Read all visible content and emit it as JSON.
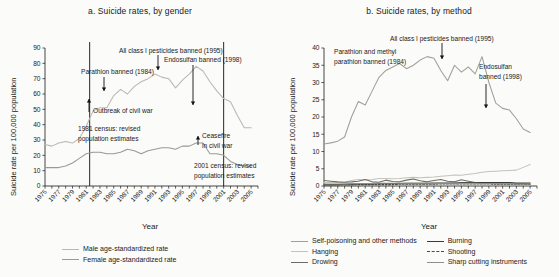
{
  "figure": {
    "background": "#fbfbf9",
    "axis_color": "#1a1a1a"
  },
  "panel_a": {
    "title": "a. Suicide rates, by gender",
    "ylabel": "Suicide rate per 100,000 population",
    "xlabel": "Year",
    "legend": [
      {
        "label": "Male age-standardized rate",
        "color": "#b9b9b0",
        "style": "solid"
      },
      {
        "label": "Female age-standardized rate",
        "color": "#9a9a92",
        "style": "solid"
      }
    ],
    "annotations": [
      {
        "name": "parathion-banned",
        "text": "Parathion banned (1984)"
      },
      {
        "name": "all-class-i-pesticides-banned",
        "text": "All class I pesticides banned (1995)"
      },
      {
        "name": "endosulfan-banned",
        "text": "Endosulfan banned (1998)"
      },
      {
        "name": "outbreak-civil-war",
        "text": "Outbreak of civil war"
      },
      {
        "name": "census-1981-line1",
        "text": "1981 census: revised"
      },
      {
        "name": "census-1981-line2",
        "text": "population estimates"
      },
      {
        "name": "census-2001-line1",
        "text": "2001 census: revised"
      },
      {
        "name": "census-2001-line2",
        "text": "population estimates"
      },
      {
        "name": "ceasefire-line1",
        "text": "Ceasefire"
      },
      {
        "name": "ceasefire-line2",
        "text": "in civil war"
      }
    ]
  },
  "panel_b": {
    "title": "b. Suicide rates, by method",
    "ylabel": "Suicide rate per 100,000 population",
    "xlabel": "Year",
    "legend": [
      {
        "label": "Self-poisoning and other methods",
        "color": "#a0a098",
        "style": "solid"
      },
      {
        "label": "Hanging",
        "color": "#c3c3bb",
        "style": "solid"
      },
      {
        "label": "Drowing",
        "color": "#6c6c66",
        "style": "solid"
      },
      {
        "label": "Burning",
        "color": "#3a3a36",
        "style": "solid"
      },
      {
        "label": "Shooting",
        "color": "#4a4a45",
        "style": "dashed"
      },
      {
        "label": "Sharp cutting instruments",
        "color": "#8e8e86",
        "style": "solid"
      }
    ],
    "annotations": [
      {
        "name": "parathion-methyl-line1",
        "text": "Parathion and methyl"
      },
      {
        "name": "parathion-methyl-line2",
        "text": "parathion banned (1984)"
      },
      {
        "name": "all-class-i-pesticides-banned",
        "text": "All class I pesticides banned (1995)"
      },
      {
        "name": "endosulfan-banned-line1",
        "text": "Endosulfan"
      },
      {
        "name": "endosulfan-banned-line2",
        "text": "banned (1998)"
      }
    ]
  },
  "chart_data": [
    {
      "type": "line",
      "panel": "a",
      "title": "a. Suicide rates, by gender",
      "xlabel": "Year",
      "ylabel": "Suicide rate per 100,000 population",
      "xlim": [
        1975,
        2006
      ],
      "ylim": [
        0,
        90
      ],
      "yticks": [
        0,
        10,
        20,
        30,
        40,
        50,
        60,
        70,
        80,
        90
      ],
      "xticks": [
        1975,
        1977,
        1979,
        1981,
        1983,
        1985,
        1987,
        1989,
        1991,
        1993,
        1995,
        1997,
        1999,
        2001,
        2003,
        2005
      ],
      "grid": false,
      "legend_position": "bottom",
      "x": [
        1975,
        1976,
        1977,
        1978,
        1979,
        1980,
        1981,
        1982,
        1983,
        1984,
        1985,
        1986,
        1987,
        1988,
        1989,
        1990,
        1991,
        1992,
        1993,
        1994,
        1995,
        1996,
        1997,
        1998,
        1999,
        2000,
        2001,
        2002,
        2003,
        2004,
        2005
      ],
      "series": [
        {
          "name": "Male age-standardized rate",
          "color": "#b9b9b0",
          "values": [
            27,
            26,
            28,
            29,
            28,
            31,
            39,
            49,
            51,
            51,
            59,
            63,
            60,
            65,
            68,
            70,
            73,
            71,
            70,
            64,
            69,
            73,
            78,
            75,
            68,
            62,
            57,
            55,
            46,
            38,
            38
          ]
        },
        {
          "name": "Female age-standardized rate",
          "color": "#9a9a92",
          "values": [
            12,
            12,
            12,
            13,
            15,
            18,
            21,
            22,
            22,
            21,
            21,
            22,
            24,
            23,
            21,
            23,
            24,
            25,
            25,
            24,
            26,
            26,
            28,
            28,
            21,
            21,
            20,
            16,
            14,
            13,
            13
          ]
        }
      ],
      "annotations": [
        {
          "text": "Parathion banned (1984)",
          "x": 1984,
          "y": 70
        },
        {
          "text": "All class I pesticides banned (1995)",
          "x": 1995,
          "y": 84
        },
        {
          "text": "Endosulfan banned (1998)",
          "x": 1998,
          "y": 80
        },
        {
          "text": "Outbreak of civil war",
          "x": 1983,
          "y": 50
        },
        {
          "text": "1981 census: revised population estimates",
          "x": 1981,
          "y": 38
        },
        {
          "text": "2001 census: revised population estimates",
          "x": 2001,
          "y": 12
        },
        {
          "text": "Ceasefire in civil war",
          "x": 2002,
          "y": 32
        }
      ],
      "vertical_rules": [
        1981.5,
        2001
      ]
    },
    {
      "type": "line",
      "panel": "b",
      "title": "b. Suicide rates, by method",
      "xlabel": "Year",
      "ylabel": "Suicide rate per 100,000 population",
      "xlim": [
        1975,
        2006
      ],
      "ylim": [
        0,
        40
      ],
      "yticks": [
        0,
        5,
        10,
        15,
        20,
        25,
        30,
        35,
        40
      ],
      "xticks": [
        1975,
        1977,
        1979,
        1981,
        1983,
        1985,
        1987,
        1989,
        1991,
        1993,
        1995,
        1997,
        1999,
        2001,
        2003,
        2005
      ],
      "grid": false,
      "legend_position": "bottom",
      "x": [
        1975,
        1976,
        1977,
        1978,
        1979,
        1980,
        1981,
        1982,
        1983,
        1984,
        1985,
        1986,
        1987,
        1988,
        1989,
        1990,
        1991,
        1992,
        1993,
        1994,
        1995,
        1996,
        1997,
        1998,
        1999,
        2000,
        2001,
        2002,
        2003,
        2004,
        2005
      ],
      "series": [
        {
          "name": "Self-poisoning and other methods",
          "color": "#a0a098",
          "values": [
            12.2,
            12.5,
            13.0,
            14.2,
            20.0,
            24.5,
            23.5,
            27.5,
            31.5,
            33.5,
            34.5,
            35.5,
            34.0,
            35.0,
            36.5,
            37.5,
            37.0,
            33.5,
            30.5,
            35.0,
            33.0,
            34.5,
            32.5,
            37.5,
            30.0,
            24.0,
            22.5,
            22.0,
            19.5,
            16.5,
            15.5
          ]
        },
        {
          "name": "Hanging",
          "color": "#c3c3bb",
          "values": [
            1.0,
            1.0,
            1.0,
            1.1,
            1.6,
            1.9,
            1.8,
            1.9,
            2.2,
            2.2,
            2.1,
            2.2,
            2.4,
            2.5,
            2.4,
            2.5,
            2.6,
            2.8,
            3.0,
            3.2,
            3.1,
            3.4,
            3.6,
            4.0,
            4.2,
            4.3,
            4.4,
            4.5,
            4.6,
            5.4,
            6.2
          ]
        },
        {
          "name": "Drowing",
          "color": "#6c6c66",
          "values": [
            1.6,
            1.4,
            1.2,
            1.1,
            1.2,
            1.4,
            1.9,
            1.2,
            1.1,
            1.7,
            1.3,
            1.2,
            1.7,
            2.0,
            1.5,
            1.2,
            1.6,
            1.9,
            1.4,
            1.2,
            1.8,
            1.4,
            1.0,
            0.9,
            0.9,
            0.8,
            0.8,
            0.7,
            0.7,
            0.7,
            0.6
          ]
        },
        {
          "name": "Burning",
          "color": "#3a3a36",
          "values": [
            0.4,
            0.4,
            0.4,
            0.5,
            0.5,
            0.6,
            0.6,
            0.6,
            0.7,
            0.7,
            0.7,
            0.7,
            0.8,
            0.8,
            0.8,
            0.8,
            0.9,
            0.9,
            0.9,
            0.9,
            1.0,
            1.0,
            1.0,
            1.0,
            1.0,
            1.0,
            1.0,
            1.0,
            0.9,
            0.9,
            0.9
          ]
        },
        {
          "name": "Shooting",
          "color": "#4a4a45",
          "values": [
            0.3,
            0.3,
            0.3,
            0.3,
            0.3,
            0.4,
            0.4,
            0.4,
            0.4,
            0.4,
            0.4,
            0.5,
            0.5,
            0.5,
            0.5,
            0.5,
            0.5,
            0.6,
            0.6,
            0.6,
            0.6,
            0.6,
            0.6,
            0.6,
            0.6,
            0.5,
            0.5,
            0.5,
            0.5,
            0.5,
            0.5
          ]
        },
        {
          "name": "Sharp cutting instruments",
          "color": "#8e8e86",
          "values": [
            0.6,
            0.6,
            0.6,
            0.6,
            0.7,
            0.7,
            0.7,
            0.7,
            0.8,
            0.8,
            0.8,
            0.8,
            0.8,
            0.8,
            0.8,
            0.8,
            0.8,
            0.8,
            0.8,
            0.8,
            0.8,
            0.8,
            0.8,
            0.7,
            0.7,
            0.7,
            0.7,
            0.7,
            0.6,
            0.6,
            0.6
          ]
        }
      ],
      "annotations": [
        {
          "text": "Parathion and methyl parathion banned (1984)",
          "x": 1984,
          "y": 38
        },
        {
          "text": "All class I pesticides banned (1995)",
          "x": 1998,
          "y": 39
        },
        {
          "text": "Endosulfan banned (1998)",
          "x": 2000,
          "y": 30
        }
      ],
      "vertical_rules": []
    }
  ]
}
